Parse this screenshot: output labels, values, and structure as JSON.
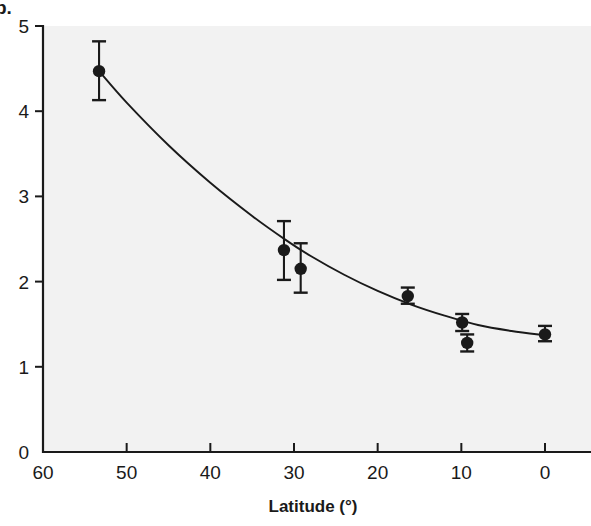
{
  "figure": {
    "panel_label": "b.",
    "background_color": "#ffffff",
    "plot_background_color": "#f2f2f2",
    "ink_color": "#1a1a1a"
  },
  "chart_data": {
    "type": "scatter",
    "title": "",
    "subtitle": "",
    "xlabel": "Latitude (°)",
    "ylabel": "",
    "xlim": [
      60,
      0
    ],
    "ylim": [
      0,
      5
    ],
    "x_inverted": true,
    "grid": false,
    "legend": null,
    "xticks": [
      60,
      50,
      40,
      30,
      20,
      10,
      0
    ],
    "xtick_labels": [
      "60",
      "50",
      "40",
      "30",
      "20",
      "10",
      "0"
    ],
    "yticks": [
      0,
      1,
      2,
      3,
      4,
      5
    ],
    "ytick_labels": [
      "0",
      "1",
      "2",
      "3",
      "4",
      "5"
    ],
    "series": [
      {
        "name": "observed",
        "marker": "filled-circle",
        "error_bars": "vertical",
        "points": [
          {
            "x": 53.3,
            "y": 4.47,
            "yerr_low": 4.13,
            "yerr_high": 4.82
          },
          {
            "x": 31.2,
            "y": 2.37,
            "yerr_low": 2.02,
            "yerr_high": 2.71
          },
          {
            "x": 29.2,
            "y": 2.15,
            "yerr_low": 1.87,
            "yerr_high": 2.45
          },
          {
            "x": 16.4,
            "y": 1.83,
            "yerr_low": 1.74,
            "yerr_high": 1.93
          },
          {
            "x": 9.9,
            "y": 1.52,
            "yerr_low": 1.42,
            "yerr_high": 1.62
          },
          {
            "x": 9.3,
            "y": 1.28,
            "yerr_low": 1.18,
            "yerr_high": 1.38
          },
          {
            "x": 0.0,
            "y": 1.38,
            "yerr_low": 1.3,
            "yerr_high": 1.48
          }
        ]
      },
      {
        "name": "fitted-curve",
        "marker": "none",
        "curve": [
          {
            "x": 53.3,
            "y": 4.47
          },
          {
            "x": 50.0,
            "y": 4.1
          },
          {
            "x": 45.0,
            "y": 3.6
          },
          {
            "x": 40.0,
            "y": 3.16
          },
          {
            "x": 35.0,
            "y": 2.77
          },
          {
            "x": 31.0,
            "y": 2.49
          },
          {
            "x": 28.0,
            "y": 2.3
          },
          {
            "x": 24.0,
            "y": 2.08
          },
          {
            "x": 20.0,
            "y": 1.89
          },
          {
            "x": 16.0,
            "y": 1.73
          },
          {
            "x": 12.0,
            "y": 1.6
          },
          {
            "x": 8.0,
            "y": 1.49
          },
          {
            "x": 4.0,
            "y": 1.42
          },
          {
            "x": 0.0,
            "y": 1.37
          }
        ]
      }
    ]
  }
}
